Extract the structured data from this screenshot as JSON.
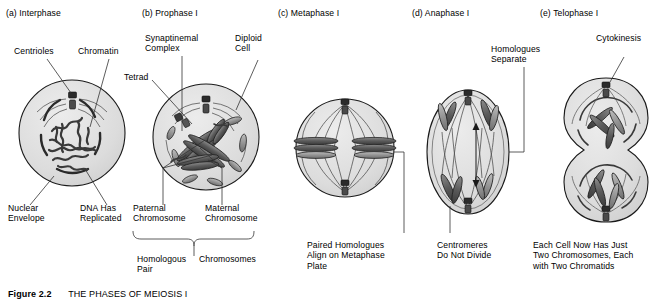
{
  "figure": {
    "caption_label": "Figure 2.2",
    "caption_text": "THE PHASES OF MEIOSIS I"
  },
  "colors": {
    "cytoplasm": "#dedede",
    "nucleoplasm": "#d0d0d0",
    "outline": "#1a1a1a",
    "chromosome_dark": "#4a4a4a",
    "chromosome_light": "#9a9a9a",
    "leader": "#333333",
    "background": "#ffffff"
  },
  "panels": [
    {
      "id": "interphase",
      "title": "(a) Interphase",
      "annotations": [
        {
          "name": "centrioles",
          "text": "Centrioles"
        },
        {
          "name": "chromatin",
          "text": "Chromatin"
        },
        {
          "name": "nuclear-envelope",
          "text": "Nuclear\nEnvelope"
        },
        {
          "name": "dna-has-replicated",
          "text": "DNA Has\nReplicated"
        }
      ]
    },
    {
      "id": "prophase-i",
      "title": "(b) Prophase I",
      "annotations": [
        {
          "name": "synaptinemal-complex",
          "text": "Synaptinemal\nComplex"
        },
        {
          "name": "diploid-cell",
          "text": "Diploid\nCell"
        },
        {
          "name": "tetrad",
          "text": "Tetrad"
        },
        {
          "name": "paternal-chromosome",
          "text": "Paternal\nChromosome"
        },
        {
          "name": "maternal-chromosome",
          "text": "Maternal\nChromosome"
        },
        {
          "name": "homologous-pair",
          "text": "Homologous\nPair"
        },
        {
          "name": "chromosomes",
          "text": "Chromosomes"
        }
      ]
    },
    {
      "id": "metaphase-i",
      "title": "(c) Metaphase I",
      "annotations": [
        {
          "name": "paired-homologues-align",
          "text": "Paired Homologues\nAlign on Metaphase\nPlate"
        }
      ]
    },
    {
      "id": "anaphase-i",
      "title": "(d) Anaphase I",
      "annotations": [
        {
          "name": "homologues-separate",
          "text": "Homologues\nSeparate"
        },
        {
          "name": "centromeres-do-not-divide",
          "text": "Centromeres\nDo Not Divide"
        }
      ]
    },
    {
      "id": "telophase-i",
      "title": "(e) Telophase I",
      "annotations": [
        {
          "name": "cytokinesis",
          "text": "Cytokinesis"
        },
        {
          "name": "each-cell-now-has",
          "text": "Each Cell Now Has Just\nTwo Chromosomes, Each\nwith Two Chromatids"
        }
      ]
    }
  ]
}
